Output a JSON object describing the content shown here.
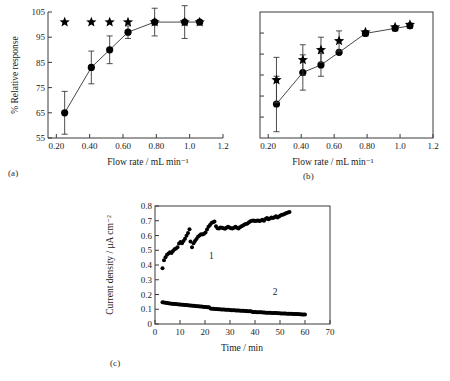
{
  "figure": {
    "panel_captions": {
      "a": "(a)",
      "b": "(b)",
      "c": "(c)"
    }
  },
  "chart_data": [
    {
      "id": "panel-a",
      "type": "scatter",
      "title": "",
      "xlabel": "Flow rate / mL min⁻¹",
      "ylabel": "% Relative response",
      "xlim": [
        0.15,
        1.2
      ],
      "ylim": [
        55,
        105
      ],
      "xticks": [
        0.2,
        0.4,
        0.6,
        0.8,
        1.0,
        1.2
      ],
      "xtick_labels": [
        "0.20",
        "0.40",
        "0.60",
        "0.80",
        "1.0",
        "1.2"
      ],
      "yticks": [
        55,
        65,
        75,
        85,
        95,
        105
      ],
      "ytick_labels": [
        "55",
        "65",
        "75",
        "85",
        "95",
        "105"
      ],
      "grid": false,
      "legend": "none",
      "series": [
        {
          "name": "circles",
          "marker": "circle",
          "connected": true,
          "x": [
            0.25,
            0.41,
            0.52,
            0.63,
            0.79,
            0.97,
            1.06
          ],
          "y": [
            65.0,
            83.0,
            90.0,
            97.0,
            101.0,
            101.0,
            101.0
          ],
          "yerr": [
            8.5,
            6.5,
            5.5,
            2.5,
            5.5,
            6.5,
            0.0
          ]
        },
        {
          "name": "stars",
          "marker": "star",
          "connected": false,
          "x": [
            0.25,
            0.41,
            0.52,
            0.63,
            0.79,
            0.97,
            1.06
          ],
          "y": [
            101.0,
            101.0,
            101.0,
            101.0,
            101.0,
            101.0,
            101.0
          ],
          "yerr": [
            0,
            0,
            0,
            0,
            0,
            0,
            0
          ]
        }
      ]
    },
    {
      "id": "panel-b",
      "type": "scatter",
      "title": "",
      "xlabel": "Flow rate / mL min⁻¹",
      "ylabel": "",
      "xlim": [
        0.15,
        1.2
      ],
      "ylim": [
        0,
        100
      ],
      "xticks": [
        0.2,
        0.4,
        0.6,
        0.8,
        1.0,
        1.2
      ],
      "xtick_labels": [
        "0.20",
        "0.40",
        "0.60",
        "0.80",
        "1.0",
        "1.2"
      ],
      "yticks": [
        16.6,
        33.3,
        50.0,
        66.6,
        83.3
      ],
      "ytick_labels": [
        "",
        "",
        "",
        "",
        ""
      ],
      "grid": false,
      "legend": "none",
      "series": [
        {
          "name": "circles",
          "marker": "circle",
          "connected": true,
          "x": [
            0.25,
            0.41,
            0.52,
            0.63,
            0.79,
            0.97,
            1.06
          ],
          "y": [
            27.0,
            52.0,
            58.0,
            68.0,
            83.0,
            87.0,
            89.0
          ],
          "yerr": [
            22.0,
            14.0,
            9.0,
            0.0,
            0.0,
            0.0,
            0.0
          ]
        },
        {
          "name": "stars",
          "marker": "star",
          "connected": false,
          "x": [
            0.25,
            0.41,
            0.52,
            0.63,
            0.79,
            0.97,
            1.06
          ],
          "y": [
            46.0,
            62.0,
            70.0,
            77.0,
            84.0,
            88.0,
            90.0
          ],
          "yerr": [
            18.0,
            12.0,
            10.0,
            8.0,
            0.0,
            0.0,
            0.0
          ]
        }
      ]
    },
    {
      "id": "panel-c",
      "type": "scatter",
      "title": "",
      "xlabel": "Time / min",
      "ylabel": "Current density / μA cm⁻²",
      "xlim": [
        0,
        70
      ],
      "ylim": [
        0,
        0.8
      ],
      "xticks": [
        0,
        10,
        20,
        30,
        40,
        50,
        60,
        70
      ],
      "xtick_labels": [
        "0",
        "10",
        "20",
        "30",
        "40",
        "50",
        "60",
        "70"
      ],
      "yticks": [
        0,
        0.1,
        0.2,
        0.3,
        0.4,
        0.5,
        0.6,
        0.7,
        0.8
      ],
      "ytick_labels": [
        "0",
        "0.1",
        "0.2",
        "0.3",
        "0.4",
        "0.5",
        "0.6",
        "0.7",
        "0.8"
      ],
      "grid": false,
      "legend": "none",
      "annotations": [
        {
          "text": "1",
          "x": 22.5,
          "y": 0.44
        },
        {
          "text": "2",
          "x": 48.0,
          "y": 0.195
        }
      ],
      "series": [
        {
          "name": "curve-1",
          "marker": "dot",
          "connected": false,
          "x": [
            3.0,
            3.6,
            4.2,
            4.8,
            5.4,
            6.0,
            6.6,
            7.2,
            7.8,
            8.4,
            9.0,
            9.6,
            10.2,
            10.8,
            11.4,
            12.0,
            12.6,
            13.2,
            13.8,
            14.2,
            14.8,
            15.4,
            16.0,
            16.6,
            17.2,
            17.8,
            18.4,
            19.0,
            19.6,
            20.2,
            20.8,
            21.4,
            22.0,
            22.6,
            23.2,
            23.8,
            24.4,
            25.0,
            25.6,
            26.2,
            26.8,
            27.4,
            28.0,
            28.6,
            29.2,
            29.8,
            30.4,
            31.0,
            31.6,
            32.2,
            32.8,
            33.4,
            34.0,
            34.6,
            35.2,
            35.8,
            36.4,
            37.0,
            37.6,
            38.2,
            38.8,
            39.4,
            40.0,
            40.6,
            41.2,
            41.8,
            42.4,
            43.0,
            43.6,
            44.2,
            44.8,
            45.4,
            46.0,
            46.6,
            47.2,
            47.8,
            48.4,
            49.0,
            49.6,
            50.2,
            50.8,
            51.4,
            52.0,
            52.6,
            53.2,
            53.8
          ],
          "y": [
            0.378,
            0.432,
            0.452,
            0.47,
            0.478,
            0.487,
            0.482,
            0.495,
            0.507,
            0.512,
            0.52,
            0.545,
            0.556,
            0.548,
            0.563,
            0.578,
            0.598,
            0.617,
            0.643,
            0.56,
            0.52,
            0.548,
            0.562,
            0.576,
            0.592,
            0.6,
            0.608,
            0.607,
            0.612,
            0.62,
            0.64,
            0.66,
            0.672,
            0.685,
            0.69,
            0.695,
            0.662,
            0.65,
            0.648,
            0.655,
            0.652,
            0.65,
            0.646,
            0.652,
            0.66,
            0.655,
            0.65,
            0.648,
            0.652,
            0.66,
            0.652,
            0.648,
            0.656,
            0.662,
            0.668,
            0.675,
            0.678,
            0.682,
            0.69,
            0.696,
            0.7,
            0.702,
            0.698,
            0.7,
            0.702,
            0.698,
            0.702,
            0.706,
            0.7,
            0.712,
            0.718,
            0.71,
            0.716,
            0.722,
            0.718,
            0.724,
            0.73,
            0.722,
            0.728,
            0.735,
            0.74,
            0.742,
            0.748,
            0.752,
            0.756,
            0.76
          ]
        },
        {
          "name": "curve-2",
          "marker": "dot",
          "connected": false,
          "x": [
            3.0,
            3.6,
            4.2,
            4.8,
            5.4,
            6.0,
            6.6,
            7.2,
            7.8,
            8.4,
            9.0,
            9.6,
            10.2,
            10.8,
            11.4,
            12.0,
            12.6,
            13.2,
            13.8,
            14.4,
            15.0,
            15.6,
            16.2,
            16.8,
            17.4,
            18.0,
            18.6,
            19.2,
            19.8,
            20.4,
            21.0,
            21.6,
            22.2,
            22.8,
            23.4,
            24.0,
            24.6,
            25.2,
            25.8,
            26.4,
            27.0,
            27.6,
            28.2,
            28.8,
            29.4,
            30.0,
            30.6,
            31.2,
            31.8,
            32.4,
            33.0,
            33.6,
            34.2,
            34.8,
            35.4,
            36.0,
            36.6,
            37.2,
            37.8,
            38.4,
            39.0,
            39.6,
            40.2,
            40.8,
            41.4,
            42.0,
            42.6,
            43.2,
            43.8,
            44.4,
            45.0,
            45.6,
            46.2,
            46.8,
            47.4,
            48.0,
            48.6,
            49.2,
            49.8,
            50.4,
            51.0,
            51.6,
            52.2,
            52.8,
            53.4,
            54.0,
            54.6,
            55.2,
            55.8,
            56.4,
            57.0,
            57.6,
            58.2,
            58.8,
            59.4,
            60.0
          ],
          "y": [
            0.148,
            0.146,
            0.144,
            0.142,
            0.141,
            0.139,
            0.138,
            0.137,
            0.136,
            0.135,
            0.134,
            0.133,
            0.132,
            0.131,
            0.13,
            0.129,
            0.128,
            0.127,
            0.126,
            0.125,
            0.124,
            0.123,
            0.122,
            0.121,
            0.12,
            0.119,
            0.118,
            0.117,
            0.116,
            0.115,
            0.114,
            0.113,
            0.105,
            0.104,
            0.103,
            0.102,
            0.101,
            0.1,
            0.1,
            0.099,
            0.098,
            0.098,
            0.097,
            0.096,
            0.096,
            0.095,
            0.094,
            0.094,
            0.093,
            0.092,
            0.092,
            0.091,
            0.09,
            0.09,
            0.089,
            0.088,
            0.088,
            0.087,
            0.086,
            0.086,
            0.082,
            0.081,
            0.081,
            0.08,
            0.08,
            0.079,
            0.079,
            0.078,
            0.078,
            0.077,
            0.077,
            0.076,
            0.076,
            0.075,
            0.075,
            0.074,
            0.074,
            0.073,
            0.073,
            0.072,
            0.072,
            0.071,
            0.071,
            0.07,
            0.07,
            0.069,
            0.069,
            0.068,
            0.068,
            0.067,
            0.067,
            0.066,
            0.066,
            0.065,
            0.065,
            0.064
          ]
        }
      ]
    }
  ]
}
